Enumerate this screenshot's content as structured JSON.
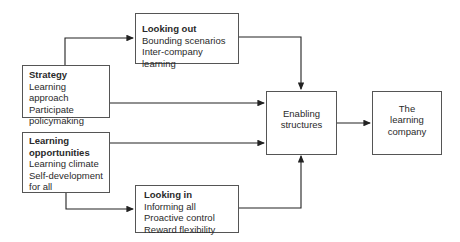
{
  "diagram": {
    "looking_out": {
      "title": "Looking out",
      "lines": [
        "Bounding scenarios",
        "Inter-company learning"
      ]
    },
    "strategy": {
      "title": "Strategy",
      "lines": [
        "Learning approach",
        "Participate",
        "policymaking"
      ]
    },
    "learning_opportunities": {
      "title_lines": [
        "Learning",
        "opportunities"
      ],
      "lines": [
        "Learning climate",
        "Self-development",
        "for all"
      ]
    },
    "looking_in": {
      "title": "Looking in",
      "lines": [
        "Informing all",
        "Proactive control",
        "Reward flexibility"
      ]
    },
    "enabling_structures": {
      "lines": [
        "Enabling",
        "structures"
      ]
    },
    "learning_company": {
      "lines": [
        "The",
        "learning",
        "company"
      ]
    }
  }
}
